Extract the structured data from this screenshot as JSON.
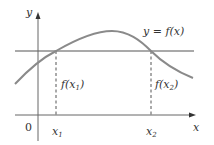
{
  "diagram": {
    "type": "function-graph",
    "axes": {
      "x_label": "x",
      "y_label": "y",
      "origin_label": "0"
    },
    "curve_label": "y = f(x)",
    "horizontal_line": "y = c (line crossing the curve twice)",
    "points": [
      {
        "x_label": "x",
        "x_sub": "1",
        "value_label_prefix": "f(x",
        "value_label_sub": "1",
        "value_label_suffix": ")"
      },
      {
        "x_label": "x",
        "x_sub": "2",
        "value_label_prefix": "f(x",
        "value_label_sub": "2",
        "value_label_suffix": ")"
      }
    ],
    "colors": {
      "curve": "#8a8a8a",
      "axes": "#555555",
      "line": "#555555",
      "text": "#333333"
    }
  }
}
